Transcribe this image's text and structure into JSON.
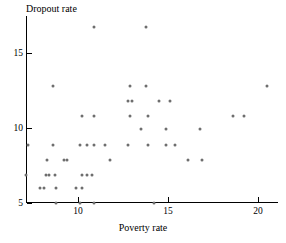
{
  "chart_data": {
    "type": "scatter",
    "title": "",
    "xlabel": "Poverty rate",
    "ylabel": "Dropout rate",
    "xlim": [
      7.1,
      21.1
    ],
    "ylim": [
      5.0,
      16.9
    ],
    "grid": false,
    "legend": null,
    "marker_color": "#6e6e6e",
    "axis_color": "#000000",
    "xticks": [
      10,
      15,
      20
    ],
    "yticks": [
      5,
      10,
      15
    ],
    "xtick_labels": [
      "10",
      "15",
      "20"
    ],
    "ytick_labels": [
      "5",
      "10",
      "15"
    ],
    "points": [
      {
        "x": 10.9,
        "y": 16.7
      },
      {
        "x": 13.8,
        "y": 16.7
      },
      {
        "x": 8.6,
        "y": 12.8
      },
      {
        "x": 12.9,
        "y": 12.8
      },
      {
        "x": 13.8,
        "y": 12.8
      },
      {
        "x": 20.5,
        "y": 12.8
      },
      {
        "x": 12.8,
        "y": 11.8
      },
      {
        "x": 13.0,
        "y": 11.8
      },
      {
        "x": 14.5,
        "y": 11.8
      },
      {
        "x": 15.1,
        "y": 11.8
      },
      {
        "x": 10.2,
        "y": 10.8
      },
      {
        "x": 10.9,
        "y": 10.8
      },
      {
        "x": 12.9,
        "y": 10.8
      },
      {
        "x": 13.9,
        "y": 10.8
      },
      {
        "x": 18.6,
        "y": 10.8
      },
      {
        "x": 19.2,
        "y": 10.8
      },
      {
        "x": 13.5,
        "y": 9.9
      },
      {
        "x": 14.9,
        "y": 9.9
      },
      {
        "x": 16.8,
        "y": 9.9
      },
      {
        "x": 7.2,
        "y": 8.9
      },
      {
        "x": 8.6,
        "y": 8.9
      },
      {
        "x": 10.1,
        "y": 8.9
      },
      {
        "x": 10.5,
        "y": 8.9
      },
      {
        "x": 10.9,
        "y": 8.9
      },
      {
        "x": 11.5,
        "y": 8.9
      },
      {
        "x": 12.8,
        "y": 8.9
      },
      {
        "x": 13.9,
        "y": 8.9
      },
      {
        "x": 14.9,
        "y": 8.9
      },
      {
        "x": 15.4,
        "y": 8.9
      },
      {
        "x": 8.3,
        "y": 7.9
      },
      {
        "x": 9.2,
        "y": 7.9
      },
      {
        "x": 9.4,
        "y": 7.9
      },
      {
        "x": 11.8,
        "y": 7.9
      },
      {
        "x": 16.1,
        "y": 7.9
      },
      {
        "x": 16.9,
        "y": 7.9
      },
      {
        "x": 7.1,
        "y": 6.9
      },
      {
        "x": 8.2,
        "y": 6.9
      },
      {
        "x": 8.4,
        "y": 6.9
      },
      {
        "x": 8.7,
        "y": 6.9
      },
      {
        "x": 10.2,
        "y": 6.9
      },
      {
        "x": 10.5,
        "y": 6.9
      },
      {
        "x": 10.8,
        "y": 6.9
      },
      {
        "x": 7.9,
        "y": 6.0
      },
      {
        "x": 8.1,
        "y": 6.0
      },
      {
        "x": 8.8,
        "y": 6.0
      },
      {
        "x": 9.9,
        "y": 6.0
      },
      {
        "x": 10.2,
        "y": 6.0
      },
      {
        "x": 8.8,
        "y": 5.0
      },
      {
        "x": 10.1,
        "y": 5.0
      },
      {
        "x": 10.9,
        "y": 5.0
      },
      {
        "x": 14.2,
        "y": 5.0
      }
    ]
  }
}
